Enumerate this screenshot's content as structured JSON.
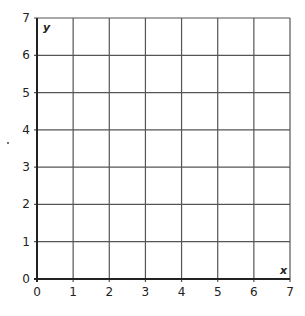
{
  "chart_data": {
    "type": "scatter",
    "title": "",
    "xlabel": "x",
    "ylabel": "y",
    "xlim": [
      0,
      7
    ],
    "ylim": [
      0,
      7
    ],
    "x_ticks": [
      "0",
      "1",
      "2",
      "3",
      "4",
      "5",
      "6",
      "7"
    ],
    "y_ticks": [
      "0",
      "1",
      "2",
      "3",
      "4",
      "5",
      "6",
      "7"
    ],
    "grid": true,
    "series": [],
    "legend": null
  },
  "colors": {
    "grid": "#555555",
    "axis": "#222222",
    "background": "#ffffff"
  }
}
